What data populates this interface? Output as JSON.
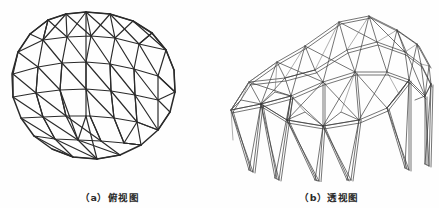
{
  "figure": {
    "background_color": "#fefefe",
    "line_color": "#2b2b2b",
    "panels": [
      {
        "id": "plan-view",
        "caption": "（a）俯视图",
        "type": "plan",
        "description": "Triangulated circular grid shell plan view"
      },
      {
        "id": "perspective-view",
        "caption": "（b）透视图",
        "type": "perspective",
        "description": "Perspective wireframe of the space truss canopy with four tapered legs"
      }
    ]
  },
  "plan_geometry": {
    "center": [
      86,
      90
    ],
    "radius": 76,
    "boundary_sides": 18,
    "grid_rings": 3,
    "grid_spacing": 25,
    "note": "Hexagonal triangulated lattice clipped by an 18-sided polygon boundary"
  },
  "perspective_geometry": {
    "legs": 4,
    "deck_nodes": 19,
    "member_style": "double-line tube",
    "note": "Four inverted-pyramid supports carrying a folded triangulated roof grid"
  }
}
